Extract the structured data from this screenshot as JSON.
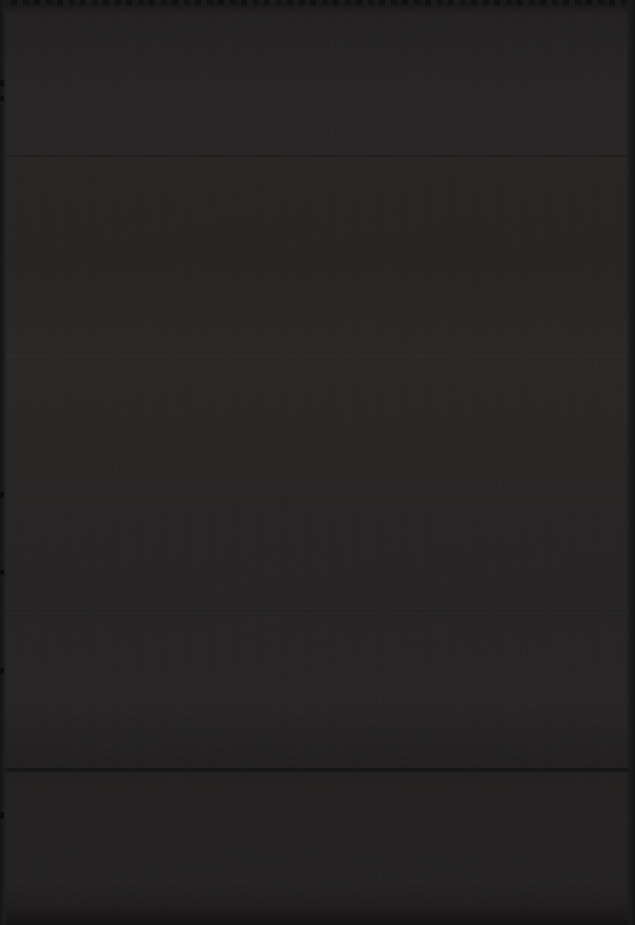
{
  "page": {
    "kind": "blank-dark-page",
    "description": "Blank dark page with no rendered text, figures, or UI controls",
    "width": 635,
    "height": 925,
    "orientation": "portrait",
    "background_color": "#262423",
    "edge_color": "#151414",
    "seam_color": "#1b1919",
    "has_visible_text": false,
    "has_visible_icons": false,
    "has_visible_controls": false,
    "visible_text_items": [],
    "bands": [
      {
        "name": "top-margin",
        "top": 0,
        "height": 14,
        "color": "#1a1818"
      },
      {
        "name": "upper-field",
        "top": 14,
        "height": 141,
        "color": "#272525"
      },
      {
        "name": "upper-mid-field",
        "top": 155,
        "height": 200,
        "color": "#282625"
      },
      {
        "name": "center-field",
        "top": 355,
        "height": 255,
        "color": "#2a2827"
      },
      {
        "name": "lower-mid-field",
        "top": 610,
        "height": 158,
        "color": "#262424"
      },
      {
        "name": "seam-band",
        "top": 768,
        "height": 22,
        "color": "#211f1f"
      },
      {
        "name": "lower-field",
        "top": 790,
        "height": 113,
        "color": "#242222"
      },
      {
        "name": "bottom-margin",
        "top": 903,
        "height": 22,
        "color": "#1a1818"
      }
    ],
    "seams": [
      {
        "name": "seam-upper",
        "y": 155
      },
      {
        "name": "seam-center",
        "y": 355
      },
      {
        "name": "seam-lower",
        "y": 610
      },
      {
        "name": "seam-bottom",
        "y": 768
      }
    ]
  }
}
